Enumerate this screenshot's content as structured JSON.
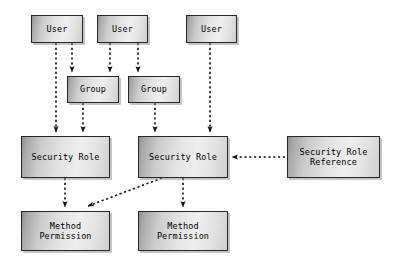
{
  "diagram": {
    "background_color": "#ffffff",
    "node_border_color": "#262626",
    "node_fill_light": "#efefef",
    "node_fill_dark": "#8f8f8f",
    "edge_color": "#1a1a1a",
    "edge_style": "dashed",
    "nodes": [
      {
        "id": "user1",
        "label": "User",
        "x": 31,
        "y": 15,
        "w": 52,
        "h": 28
      },
      {
        "id": "user2",
        "label": "User",
        "x": 97,
        "y": 15,
        "w": 51,
        "h": 28
      },
      {
        "id": "user3",
        "label": "User",
        "x": 186,
        "y": 15,
        "w": 51,
        "h": 28
      },
      {
        "id": "group1",
        "label": "Group",
        "x": 67,
        "y": 76,
        "w": 52,
        "h": 27
      },
      {
        "id": "group2",
        "label": "Group",
        "x": 128,
        "y": 76,
        "w": 52,
        "h": 27
      },
      {
        "id": "role1",
        "label": "Security Role",
        "x": 21,
        "y": 136,
        "w": 89,
        "h": 42
      },
      {
        "id": "role2",
        "label": "Security Role",
        "x": 138,
        "y": 136,
        "w": 90,
        "h": 42
      },
      {
        "id": "roleref",
        "label": "Security Role\nReference",
        "x": 287,
        "y": 136,
        "w": 93,
        "h": 42
      },
      {
        "id": "perm1",
        "label": "Method\nPermission",
        "x": 21,
        "y": 211,
        "w": 89,
        "h": 40
      },
      {
        "id": "perm2",
        "label": "Method\nPermission",
        "x": 138,
        "y": 211,
        "w": 90,
        "h": 40
      }
    ],
    "edges": [
      {
        "id": "user1-to-role1",
        "from": "user1",
        "to": "role1",
        "path": "M56,43 L56,132"
      },
      {
        "id": "user1-to-group1",
        "from": "user1",
        "to": "group1",
        "path": "M72,43 L72,72"
      },
      {
        "id": "user2-to-group1",
        "from": "user2",
        "to": "group1",
        "path": "M110,43 L110,72"
      },
      {
        "id": "user2-to-group2",
        "from": "user2",
        "to": "group2",
        "path": "M138,43 L138,72"
      },
      {
        "id": "group1-to-role1",
        "from": "group1",
        "to": "role1",
        "path": "M83,103 L83,132"
      },
      {
        "id": "group2-to-role2",
        "from": "group2",
        "to": "role2",
        "path": "M155,103 L155,132"
      },
      {
        "id": "user3-to-role2",
        "from": "user3",
        "to": "role2",
        "path": "M210,43 L210,132"
      },
      {
        "id": "roleref-to-role2",
        "from": "roleref",
        "to": "role2",
        "path": "M285,157 L232,157"
      },
      {
        "id": "role1-to-perm1",
        "from": "role1",
        "to": "perm1",
        "path": "M65,178 L65,207"
      },
      {
        "id": "role2-to-perm2",
        "from": "role2",
        "to": "perm2",
        "path": "M183,178 L183,207"
      },
      {
        "id": "role2-to-perm1",
        "from": "role2",
        "to": "perm1",
        "path": "M162,178 L88,206"
      }
    ]
  }
}
